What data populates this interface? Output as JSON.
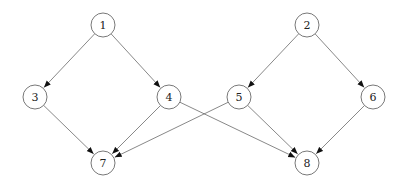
{
  "diagram": {
    "type": "directed-graph",
    "node_radius": 12,
    "colors": {
      "stroke": "#555555",
      "fill": "#ffffff",
      "text": "#222222"
    },
    "nodes": [
      {
        "id": "1",
        "label": "1",
        "x": 103,
        "y": 25
      },
      {
        "id": "2",
        "label": "2",
        "x": 307,
        "y": 25
      },
      {
        "id": "3",
        "label": "3",
        "x": 35,
        "y": 97
      },
      {
        "id": "4",
        "label": "4",
        "x": 169,
        "y": 97
      },
      {
        "id": "5",
        "label": "5",
        "x": 239,
        "y": 97
      },
      {
        "id": "6",
        "label": "6",
        "x": 373,
        "y": 97
      },
      {
        "id": "7",
        "label": "7",
        "x": 103,
        "y": 163
      },
      {
        "id": "8",
        "label": "8",
        "x": 307,
        "y": 163
      }
    ],
    "edges": [
      {
        "from": "1",
        "to": "3"
      },
      {
        "from": "1",
        "to": "4"
      },
      {
        "from": "2",
        "to": "5"
      },
      {
        "from": "2",
        "to": "6"
      },
      {
        "from": "3",
        "to": "7"
      },
      {
        "from": "4",
        "to": "7"
      },
      {
        "from": "4",
        "to": "8"
      },
      {
        "from": "5",
        "to": "7"
      },
      {
        "from": "5",
        "to": "8"
      },
      {
        "from": "6",
        "to": "8"
      }
    ]
  }
}
